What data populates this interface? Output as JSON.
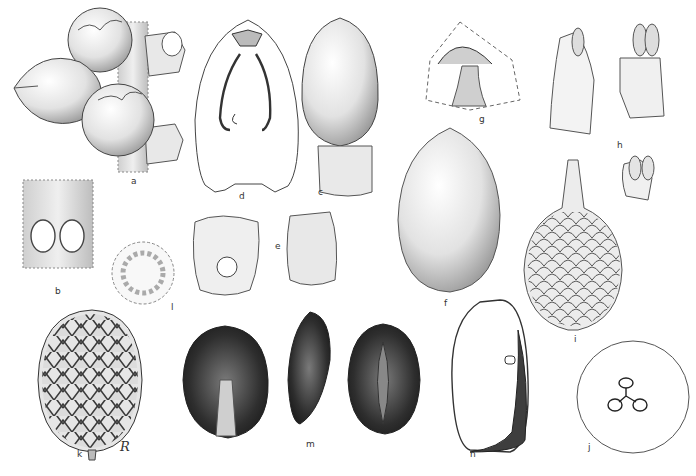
{
  "plate": {
    "background": "#ffffff",
    "ink_color": "#2a2a2a",
    "shading_light": "#e4e4e4",
    "shading_dark": "#3a3a3a",
    "signature": "R"
  },
  "figures": [
    {
      "id": "a",
      "label": "a",
      "subject": "fruits-on-rachilla"
    },
    {
      "id": "b",
      "label": "b",
      "subject": "rachilla-segment-with-scars"
    },
    {
      "id": "c",
      "label": "c",
      "subject": "flower-bud-with-calyx"
    },
    {
      "id": "d",
      "label": "d",
      "subject": "flower-longitudinal-section"
    },
    {
      "id": "e",
      "label": "e",
      "subject": "calyx-cups"
    },
    {
      "id": "f",
      "label": "f",
      "subject": "petal-bud"
    },
    {
      "id": "g",
      "label": "g",
      "subject": "androecium-section"
    },
    {
      "id": "h",
      "label": "h",
      "subject": "stamens"
    },
    {
      "id": "i",
      "label": "i",
      "subject": "scaly-gynoecium"
    },
    {
      "id": "j",
      "label": "j",
      "subject": "ovary-cross-section"
    },
    {
      "id": "k",
      "label": "k",
      "subject": "scaly-fruit"
    },
    {
      "id": "l",
      "label": "l",
      "subject": "staminodial-ring"
    },
    {
      "id": "m",
      "label": "m",
      "subject": "seeds-three-views"
    },
    {
      "id": "n",
      "label": "n",
      "subject": "seed-longitudinal-section"
    }
  ]
}
